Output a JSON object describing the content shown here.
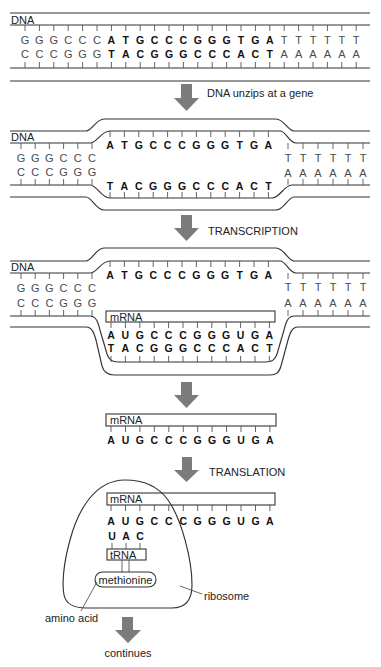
{
  "colors": {
    "line": "#333333",
    "tick": "#555555",
    "arrow": "#7b7b7b",
    "text": "#222222",
    "base_regular": "#4a4a4a",
    "base_bold": "#111111"
  },
  "dna_helix": {
    "label": "DNA",
    "left_top": [
      "G",
      "G",
      "G",
      "C",
      "C",
      "C"
    ],
    "gene_top": [
      "A",
      "T",
      "G",
      "C",
      "C",
      "C",
      "G",
      "G",
      "G",
      "T",
      "G",
      "A"
    ],
    "right_top": [
      "T",
      "T",
      "T",
      "T",
      "T",
      "T"
    ],
    "left_bottom": [
      "C",
      "C",
      "C",
      "G",
      "G",
      "G"
    ],
    "gene_bottom": [
      "T",
      "A",
      "C",
      "G",
      "G",
      "G",
      "C",
      "C",
      "C",
      "A",
      "C",
      "T"
    ],
    "right_bottom": [
      "A",
      "A",
      "A",
      "A",
      "A",
      "A"
    ]
  },
  "unzipped": {
    "label": "DNA",
    "left_top": [
      "G",
      "G",
      "G",
      "C",
      "C",
      "C"
    ],
    "left_bottom": [
      "C",
      "C",
      "C",
      "G",
      "G",
      "G"
    ],
    "gene_top": [
      "A",
      "T",
      "G",
      "C",
      "C",
      "C",
      "G",
      "G",
      "G",
      "T",
      "G",
      "A"
    ],
    "gene_bottom": [
      "T",
      "A",
      "C",
      "G",
      "G",
      "G",
      "C",
      "C",
      "C",
      "A",
      "C",
      "T"
    ],
    "right_top": [
      "T",
      "T",
      "T",
      "T",
      "T",
      "T"
    ],
    "right_bottom": [
      "A",
      "A",
      "A",
      "A",
      "A",
      "A"
    ]
  },
  "transcription_state": {
    "label": "DNA",
    "left_top": [
      "G",
      "G",
      "G",
      "C",
      "C",
      "C"
    ],
    "left_bottom": [
      "C",
      "C",
      "C",
      "G",
      "G",
      "G"
    ],
    "gene_top": [
      "A",
      "T",
      "G",
      "C",
      "C",
      "C",
      "G",
      "G",
      "G",
      "T",
      "G",
      "A"
    ],
    "right_top": [
      "T",
      "T",
      "T",
      "T",
      "T",
      "T"
    ],
    "right_bottom": [
      "A",
      "A",
      "A",
      "A",
      "A",
      "A"
    ],
    "mrna_label": "mRNA",
    "mrna": [
      "A",
      "U",
      "G",
      "C",
      "C",
      "C",
      "G",
      "G",
      "G",
      "U",
      "G",
      "A"
    ],
    "template": [
      "T",
      "A",
      "C",
      "G",
      "G",
      "G",
      "C",
      "C",
      "C",
      "A",
      "C",
      "T"
    ]
  },
  "free_mrna": {
    "label": "mRNA",
    "sequence": [
      "A",
      "U",
      "G",
      "C",
      "C",
      "C",
      "G",
      "G",
      "G",
      "U",
      "G",
      "A"
    ]
  },
  "translation_state": {
    "mrna_label": "mRNA",
    "mrna": [
      "A",
      "U",
      "G",
      "C",
      "C",
      "C",
      "G",
      "G",
      "G",
      "U",
      "G",
      "A"
    ],
    "anticodon": [
      "U",
      "A",
      "C"
    ],
    "trna_label": "tRNA",
    "amino_acid": "methionine",
    "amino_acid_label": "amino acid",
    "ribosome_label": "ribosome"
  },
  "steps": [
    {
      "label": "DNA unzips at a gene"
    },
    {
      "label": "TRANSCRIPTION"
    },
    {
      "label": ""
    },
    {
      "label": "TRANSLATION"
    },
    {
      "label": "continues"
    }
  ]
}
